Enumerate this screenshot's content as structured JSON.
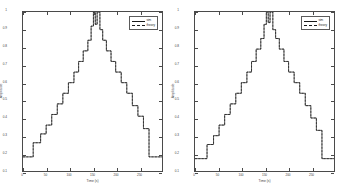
{
  "figure": {
    "background": "#ffffff",
    "line_color": "#1a1a1a",
    "axis_color": "#4a4a4a"
  },
  "panels": [
    {
      "name": "left-panel",
      "legend": {
        "entries": [
          {
            "label": "sim",
            "style": "solid"
          },
          {
            "label": "theory",
            "style": "dashed"
          }
        ]
      }
    },
    {
      "name": "right-panel",
      "legend": {
        "entries": [
          {
            "label": "sim",
            "style": "solid"
          },
          {
            "label": "theory",
            "style": "dashed"
          }
        ]
      }
    }
  ],
  "chart_data": [
    {
      "type": "line",
      "title": "",
      "xlabel": "Time (s)",
      "ylabel": "Amplitude",
      "xlim": [
        0,
        300
      ],
      "ylim": [
        0.1,
        1.0
      ],
      "grid": false,
      "legend_position": "upper-right",
      "xticks": [
        0,
        50,
        100,
        150,
        200,
        250
      ],
      "xticklabels": [
        "0",
        "50",
        "100",
        "150",
        "200",
        "250"
      ],
      "yticks": [
        0.1,
        0.2,
        0.3,
        0.4,
        0.5,
        0.6,
        0.7,
        0.8,
        0.9,
        1.0
      ],
      "yticklabels": [
        "0.1",
        "0.2",
        "0.3",
        "0.4",
        "0.5",
        "0.6",
        "0.7",
        "0.8",
        "0.9",
        "1"
      ],
      "series": [
        {
          "name": "sim",
          "style": "solid",
          "x": [
            0,
            22,
            22,
            38,
            38,
            50,
            50,
            62,
            62,
            74,
            74,
            86,
            86,
            98,
            98,
            110,
            110,
            120,
            120,
            130,
            130,
            140,
            140,
            147,
            147,
            152,
            152,
            156,
            156,
            160,
            160,
            166,
            166,
            172,
            172,
            180,
            180,
            190,
            190,
            200,
            200,
            212,
            212,
            224,
            224,
            236,
            236,
            248,
            248,
            260,
            260,
            272,
            272,
            300
          ],
          "y": [
            0.18,
            0.18,
            0.26,
            0.26,
            0.31,
            0.31,
            0.36,
            0.36,
            0.42,
            0.42,
            0.48,
            0.48,
            0.54,
            0.54,
            0.6,
            0.6,
            0.66,
            0.66,
            0.72,
            0.72,
            0.78,
            0.78,
            0.84,
            0.84,
            0.92,
            0.92,
            1.0,
            1.0,
            0.93,
            0.93,
            1.0,
            1.0,
            0.9,
            0.9,
            0.84,
            0.84,
            0.78,
            0.78,
            0.72,
            0.72,
            0.66,
            0.66,
            0.6,
            0.6,
            0.54,
            0.54,
            0.47,
            0.47,
            0.41,
            0.41,
            0.34,
            0.34,
            0.18,
            0.18
          ]
        },
        {
          "name": "theory",
          "style": "dashed",
          "x": [
            0,
            22,
            22,
            38,
            38,
            50,
            50,
            62,
            62,
            74,
            74,
            86,
            86,
            98,
            98,
            110,
            110,
            120,
            120,
            130,
            130,
            140,
            140,
            147,
            147,
            152,
            152,
            156,
            156,
            160,
            160,
            166,
            166,
            172,
            172,
            180,
            180,
            190,
            190,
            200,
            200,
            212,
            212,
            224,
            224,
            236,
            236,
            248,
            248,
            260,
            260,
            272,
            272,
            300
          ],
          "y": [
            0.18,
            0.18,
            0.26,
            0.26,
            0.31,
            0.31,
            0.36,
            0.36,
            0.42,
            0.42,
            0.48,
            0.48,
            0.54,
            0.54,
            0.6,
            0.6,
            0.66,
            0.66,
            0.72,
            0.72,
            0.78,
            0.78,
            0.84,
            0.84,
            0.92,
            0.92,
            1.0,
            1.0,
            0.93,
            0.93,
            1.0,
            1.0,
            0.9,
            0.9,
            0.84,
            0.84,
            0.78,
            0.78,
            0.72,
            0.72,
            0.66,
            0.66,
            0.6,
            0.6,
            0.54,
            0.54,
            0.47,
            0.47,
            0.41,
            0.41,
            0.34,
            0.34,
            0.18,
            0.18
          ]
        }
      ]
    },
    {
      "type": "line",
      "title": "",
      "xlabel": "Time (s)",
      "ylabel": "Amplitude",
      "xlim": [
        0,
        300
      ],
      "ylim": [
        0.1,
        1.0
      ],
      "grid": false,
      "legend_position": "upper-right",
      "xticks": [
        0,
        50,
        100,
        150,
        200,
        250
      ],
      "xticklabels": [
        "0",
        "50",
        "100",
        "150",
        "200",
        "250"
      ],
      "yticks": [
        0.1,
        0.2,
        0.3,
        0.4,
        0.5,
        0.6,
        0.7,
        0.8,
        0.9,
        1.0
      ],
      "yticklabels": [
        "0.1",
        "0.2",
        "0.3",
        "0.4",
        "0.5",
        "0.6",
        "0.7",
        "0.8",
        "0.9",
        "1"
      ],
      "series": [
        {
          "name": "sim",
          "style": "solid",
          "x": [
            0,
            26,
            26,
            40,
            40,
            52,
            52,
            64,
            64,
            76,
            76,
            88,
            88,
            100,
            100,
            112,
            112,
            122,
            122,
            132,
            132,
            142,
            142,
            149,
            149,
            154,
            154,
            158,
            158,
            162,
            162,
            168,
            168,
            174,
            174,
            182,
            182,
            192,
            192,
            202,
            202,
            214,
            214,
            226,
            226,
            238,
            238,
            250,
            250,
            262,
            262,
            274,
            274,
            300
          ],
          "y": [
            0.17,
            0.17,
            0.25,
            0.25,
            0.3,
            0.3,
            0.36,
            0.36,
            0.42,
            0.42,
            0.48,
            0.48,
            0.54,
            0.54,
            0.6,
            0.6,
            0.66,
            0.66,
            0.72,
            0.72,
            0.79,
            0.79,
            0.85,
            0.85,
            0.93,
            0.93,
            1.0,
            1.0,
            0.94,
            0.94,
            1.0,
            1.0,
            0.9,
            0.9,
            0.85,
            0.85,
            0.79,
            0.79,
            0.72,
            0.72,
            0.66,
            0.66,
            0.6,
            0.6,
            0.54,
            0.54,
            0.47,
            0.47,
            0.4,
            0.4,
            0.33,
            0.33,
            0.17,
            0.17
          ]
        },
        {
          "name": "theory",
          "style": "dashed",
          "x": [
            0,
            26,
            26,
            40,
            40,
            52,
            52,
            64,
            64,
            76,
            76,
            88,
            88,
            100,
            100,
            112,
            112,
            122,
            122,
            132,
            132,
            142,
            142,
            149,
            149,
            154,
            154,
            158,
            158,
            162,
            162,
            168,
            168,
            174,
            174,
            182,
            182,
            192,
            192,
            202,
            202,
            214,
            214,
            226,
            226,
            238,
            238,
            250,
            250,
            262,
            262,
            274,
            274,
            300
          ],
          "y": [
            0.17,
            0.17,
            0.25,
            0.25,
            0.3,
            0.3,
            0.36,
            0.36,
            0.42,
            0.42,
            0.48,
            0.48,
            0.54,
            0.54,
            0.6,
            0.6,
            0.66,
            0.66,
            0.72,
            0.72,
            0.79,
            0.79,
            0.85,
            0.85,
            0.93,
            0.93,
            1.0,
            1.0,
            0.94,
            0.94,
            1.0,
            1.0,
            0.9,
            0.9,
            0.85,
            0.85,
            0.79,
            0.79,
            0.72,
            0.72,
            0.66,
            0.66,
            0.6,
            0.6,
            0.54,
            0.54,
            0.47,
            0.47,
            0.4,
            0.4,
            0.33,
            0.33,
            0.17,
            0.17
          ]
        }
      ]
    }
  ]
}
